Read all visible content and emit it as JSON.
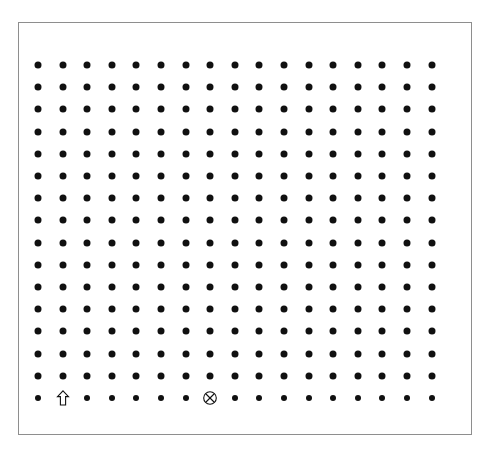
{
  "figure": {
    "background_color": "#ffffff",
    "frame": {
      "border_color": "#8e8e8e",
      "border_width_px": 1,
      "x": 18,
      "y": 22,
      "width": 454,
      "height": 413
    }
  },
  "grid": {
    "columns": 17,
    "rows": 16,
    "origin_x": 38,
    "origin_y": 65,
    "spacing_x": 24.6,
    "spacing_y": 22.2,
    "dot_color": "#101010",
    "dot_diameter_px": 7,
    "last_row_dot_diameter_px": 6
  },
  "markers": [
    {
      "id": "up-arrow",
      "icon": "up-arrow-outline-icon",
      "glyph": "⇧",
      "label": "Outlined up arrow",
      "row": 16,
      "column": 2,
      "fill": "#ffffff",
      "stroke": "#101010"
    },
    {
      "id": "circled-x",
      "icon": "circled-x-icon",
      "glyph": "⊗",
      "label": "Circled cross",
      "row": 16,
      "column": 8,
      "fill": "#ffffff",
      "stroke": "#101010"
    }
  ],
  "chart_data": {
    "type": "scatter",
    "subtitle": "",
    "xlabel": "",
    "ylabel": "",
    "grid": false,
    "legend_position": "none",
    "xlim": [
      1,
      17
    ],
    "ylim": [
      1,
      16
    ],
    "xticks": [],
    "yticks": [],
    "series": [
      {
        "name": "grid-dots",
        "marker": "filled-circle",
        "color": "#101010",
        "note": "17 columns x 16 rows regular lattice, all points filled circles except two substituted marker symbols in the bottom row",
        "point_count": 270
      },
      {
        "name": "up-arrow-marker",
        "marker": "up-arrow-outline",
        "color": "#101010",
        "points": [
          {
            "x": 2,
            "y": 16
          }
        ]
      },
      {
        "name": "circled-x-marker",
        "marker": "circled-x",
        "color": "#101010",
        "points": [
          {
            "x": 8,
            "y": 16
          }
        ]
      }
    ]
  }
}
